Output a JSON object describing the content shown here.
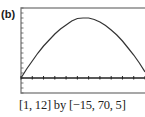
{
  "panel_label": "(b)",
  "caption": "[1, 12] by [−15, 70, 5]",
  "chart_data": {
    "type": "line",
    "title": "",
    "xlabel": "",
    "ylabel": "",
    "xlim": [
      1,
      12
    ],
    "ylim": [
      -15,
      70
    ],
    "xscl": 1,
    "yscl": 5,
    "grid": false,
    "legend": "none",
    "series": [
      {
        "name": "curve",
        "x": [
          1,
          1.5,
          2,
          2.5,
          3,
          3.5,
          4,
          4.5,
          5,
          5.5,
          6,
          6.5,
          7,
          7.5,
          8,
          8.5,
          9,
          9.5,
          10,
          10.5,
          11,
          11.5,
          12
        ],
        "y": [
          0,
          9,
          17,
          25,
          32,
          38,
          44,
          49,
          53,
          57,
          59.5,
          60,
          60,
          58.5,
          56,
          52.5,
          48,
          43,
          37,
          30,
          23,
          15,
          6
        ]
      }
    ]
  },
  "colors": {
    "frame": "#8a8a8a",
    "axis": "#222222",
    "curve": "#333333"
  }
}
